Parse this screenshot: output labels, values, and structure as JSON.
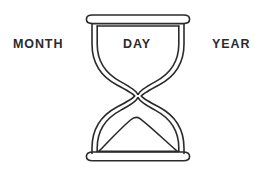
{
  "canvas": {
    "width": 273,
    "height": 172,
    "background_color": "#ffffff"
  },
  "figure": {
    "name": "hourglass",
    "style": "line-art outline, double-walled glass",
    "stroke_color": "#2b2b2b",
    "fill_color": "#ffffff",
    "stroke_width": 1.6,
    "parts": [
      "top-cap",
      "upper-bulb",
      "waist-neck",
      "lower-bulb",
      "sand-mound",
      "bottom-cap"
    ]
  },
  "labels": {
    "month": "MONTH",
    "day": "DAY",
    "year": "YEAR",
    "text_color": "#2b2b2b"
  }
}
